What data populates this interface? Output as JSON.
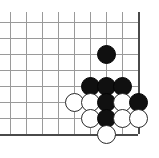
{
  "diagram": {
    "board": {
      "columns": 9,
      "rows": 8,
      "cell_size": 16,
      "origin_x": 10,
      "origin_y": 22,
      "line_color": "#9a9a9a",
      "edge_color": "#4a4a4a",
      "background_color": "#ffffff",
      "edge_right_column": 8,
      "edge_bottom_row": 7,
      "x_positions": [
        10,
        26,
        42,
        58,
        74,
        90,
        106,
        122,
        138
      ],
      "y_positions": [
        22,
        38,
        54,
        70,
        86,
        102,
        118,
        134
      ]
    },
    "stone_colors": {
      "black": "#101010",
      "white": "#ffffff",
      "white_outline": "#2a2a2a"
    },
    "stones": [
      {
        "color": "black",
        "col": 6,
        "row": 2,
        "label": "black-stone-c6-r2"
      },
      {
        "color": "black",
        "col": 5,
        "row": 4,
        "label": "black-stone-c5-r4"
      },
      {
        "color": "black",
        "col": 6,
        "row": 4,
        "label": "black-stone-c6-r4"
      },
      {
        "color": "black",
        "col": 7,
        "row": 4,
        "label": "black-stone-c7-r4"
      },
      {
        "color": "white",
        "col": 4,
        "row": 5,
        "label": "white-stone-c4-r5"
      },
      {
        "color": "white",
        "col": 5,
        "row": 5,
        "label": "white-stone-c5-r5"
      },
      {
        "color": "black",
        "col": 6,
        "row": 5,
        "label": "black-stone-c6-r5"
      },
      {
        "color": "white",
        "col": 7,
        "row": 5,
        "label": "white-stone-c7-r5"
      },
      {
        "color": "black",
        "col": 8,
        "row": 5,
        "label": "black-stone-c8-r5"
      },
      {
        "color": "white",
        "col": 5,
        "row": 6,
        "label": "white-stone-c5-r6"
      },
      {
        "color": "black",
        "col": 6,
        "row": 6,
        "label": "black-stone-c6-r6"
      },
      {
        "color": "white",
        "col": 7,
        "row": 6,
        "label": "white-stone-c7-r6"
      },
      {
        "color": "white",
        "col": 8,
        "row": 6,
        "label": "white-stone-c8-r6"
      },
      {
        "color": "white",
        "col": 6,
        "row": 7,
        "label": "white-stone-c6-r7"
      }
    ]
  }
}
